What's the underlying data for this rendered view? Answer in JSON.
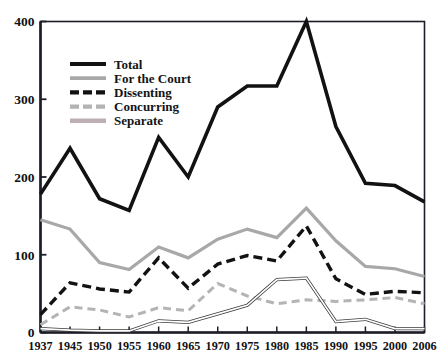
{
  "chart_data": {
    "type": "line",
    "title": "",
    "subtitle": "",
    "xlabel": "",
    "ylabel": "",
    "categories": [
      "1937",
      "1945",
      "1950",
      "1955",
      "1960",
      "1965",
      "1970",
      "1975",
      "1980",
      "1985",
      "1990",
      "1995",
      "2000",
      "2006"
    ],
    "x_tick_labels": [
      "1937",
      "1945",
      "1950",
      "1955",
      "1960",
      "1965",
      "1970",
      "1975",
      "1980",
      "1985",
      "1990",
      "1995",
      "2000",
      "2006"
    ],
    "y_tick_labels": [
      "0",
      "100",
      "200",
      "300",
      "400"
    ],
    "y_ticks": [
      0,
      100,
      200,
      300,
      400
    ],
    "ylim": [
      0,
      400
    ],
    "grid": false,
    "legend_position": "upper-left-inside",
    "series": [
      {
        "name": "Total",
        "style": "solid",
        "color": "#121212",
        "width": 3.6,
        "values": [
          178,
          237,
          172,
          157,
          251,
          200,
          290,
          317,
          317,
          400,
          265,
          192,
          189,
          168
        ]
      },
      {
        "name": "For the Court",
        "style": "solid",
        "color": "#a8a8a8",
        "width": 3.2,
        "values": [
          145,
          133,
          90,
          81,
          110,
          96,
          120,
          133,
          122,
          160,
          118,
          85,
          82,
          72
        ]
      },
      {
        "name": "Dissenting",
        "style": "dashed",
        "color": "#121212",
        "width": 3.4,
        "values": [
          23,
          64,
          56,
          52,
          96,
          57,
          88,
          99,
          92,
          137,
          69,
          49,
          53,
          51
        ]
      },
      {
        "name": "Concurring",
        "style": "dashed",
        "color": "#b4b4b4",
        "width": 3.0,
        "values": [
          10,
          33,
          29,
          20,
          32,
          28,
          63,
          47,
          37,
          42,
          40,
          42,
          45,
          37
        ]
      },
      {
        "name": "Separate",
        "style": "solid-outline",
        "color": "#9b9b9b",
        "width": 1.3,
        "values": [
          5,
          3,
          2,
          2,
          15,
          13,
          24,
          35,
          68,
          70,
          14,
          17,
          5,
          5
        ]
      }
    ]
  },
  "legend": {
    "items": [
      {
        "label": "Total"
      },
      {
        "label": "For the Court"
      },
      {
        "label": "Dissenting"
      },
      {
        "label": "Concurring"
      },
      {
        "label": "Separate"
      }
    ]
  },
  "colors": {
    "axis": "#1d1d28",
    "background": "#ffffff",
    "total": "#121212",
    "for_the_court": "#a8a8a8",
    "dissenting": "#121212",
    "concurring": "#b4b4b4",
    "separate": "#9b9b9b"
  }
}
